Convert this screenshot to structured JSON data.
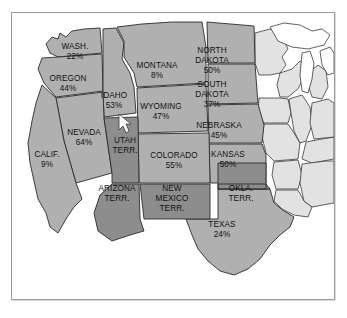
{
  "figure": {
    "kind": "thematic-map",
    "region": "Western United States",
    "frame_border_color": "#9a9a9a",
    "background_color": "#ffffff"
  },
  "legend_colors": {
    "shaded_state_fill": "#b0b0b0",
    "territory_fill": "#8d8d8d",
    "plain_state_fill": "#e2e2e2",
    "water_fill": "#ffffff",
    "outline": "#2b2b2b"
  },
  "cursor": {
    "name": "mouse-pointer",
    "x": 118,
    "y": 113,
    "color": "#ffffff"
  },
  "map_data": {
    "type": "choropleth-map",
    "title": "",
    "value_suffix": "%",
    "regions": [
      {
        "id": "washington",
        "name": "WASH.",
        "value": "22%",
        "has_value": true,
        "class": "shaded",
        "label_x": 63,
        "label_y": 36,
        "line2_dy": 10
      },
      {
        "id": "oregon",
        "name": "OREGON",
        "value": "44%",
        "has_value": true,
        "class": "shaded",
        "label_x": 56,
        "label_y": 70,
        "line2_dy": 10
      },
      {
        "id": "idaho",
        "name": "IDAHO",
        "value": "53%",
        "has_value": true,
        "class": "shaded",
        "label_x": 101,
        "label_y": 85,
        "line2_dy": 10
      },
      {
        "id": "montana",
        "name": "MONTANA",
        "value": "8%",
        "has_value": true,
        "class": "shaded",
        "label_x": 152,
        "label_y": 55,
        "line2_dy": 10
      },
      {
        "id": "wyoming",
        "name": "WYOMING",
        "value": "47%",
        "has_value": true,
        "class": "shaded",
        "label_x": 157,
        "label_y": 98,
        "line2_dy": 10
      },
      {
        "id": "north-dakota",
        "name": "NORTH DAKOTA",
        "value": "50%",
        "has_value": true,
        "class": "shaded",
        "label_x": 219,
        "label_y": 44,
        "line2_dy": 10
      },
      {
        "id": "south-dakota",
        "name": "SOUTH DAKOTA",
        "value": "37%",
        "has_value": true,
        "class": "shaded",
        "label_x": 219,
        "label_y": 82,
        "line2_dy": 10
      },
      {
        "id": "nebraska",
        "name": "NEBRASKA",
        "value": "45%",
        "has_value": true,
        "class": "shaded",
        "label_x": 222,
        "label_y": 120,
        "line2_dy": 10
      },
      {
        "id": "kansas",
        "name": "KANSAS",
        "value": "50%",
        "has_value": true,
        "class": "shaded",
        "label_x": 230,
        "label_y": 152,
        "line2_dy": 10
      },
      {
        "id": "nevada",
        "name": "NEVADA",
        "value": "64%",
        "has_value": true,
        "class": "shaded",
        "label_x": 76,
        "label_y": 131,
        "line2_dy": 10
      },
      {
        "id": "california",
        "name": "CALIF.",
        "value": "9%",
        "has_value": true,
        "class": "shaded",
        "label_x": 39,
        "label_y": 156,
        "line2_dy": 10
      },
      {
        "id": "colorado",
        "name": "COLORADO",
        "value": "55%",
        "has_value": true,
        "class": "shaded",
        "label_x": 170,
        "label_y": 148,
        "line2_dy": 10
      },
      {
        "id": "texas",
        "name": "TEXAS",
        "value": "24%",
        "has_value": true,
        "class": "shaded",
        "label_x": 226,
        "label_y": 225,
        "line2_dy": 10
      },
      {
        "id": "utah-terr",
        "name": "UTAH",
        "value": "TERR.",
        "has_value": false,
        "class": "territory",
        "label_x": 122,
        "label_y": 137,
        "line2_dy": 10
      },
      {
        "id": "arizona-terr",
        "name": "ARIZONA",
        "value": "TERR.",
        "has_value": false,
        "class": "territory",
        "label_x": 115,
        "label_y": 190,
        "line2_dy": 10
      },
      {
        "id": "new-mexico-terr",
        "name": "NEW MEXICO",
        "value": "TERR.",
        "has_value": false,
        "class": "territory",
        "label_x": 172,
        "label_y": 190,
        "line2_dy": 10
      },
      {
        "id": "okla-terr",
        "name": "OKLA.",
        "value": "TERR.",
        "has_value": false,
        "class": "territory",
        "label_x": 245,
        "label_y": 190,
        "line2_dy": 10
      }
    ],
    "labels": {
      "washington": {
        "line1": "WASH.",
        "line2": "22%"
      },
      "oregon": {
        "line1": "OREGON",
        "line2": "44%"
      },
      "idaho": {
        "line1": "IDAHO",
        "line2": "53%"
      },
      "montana": {
        "line1": "MONTANA",
        "line2": "8%"
      },
      "wyoming": {
        "line1": "WYOMING",
        "line2": "47%"
      },
      "north_dakota": {
        "line1": "NORTH",
        "line2": "DAKOTA",
        "line3": "50%"
      },
      "south_dakota": {
        "line1": "SOUTH",
        "line2": "DAKOTA",
        "line3": "37%"
      },
      "nebraska": {
        "line1": "NEBRASKA",
        "line2": "45%"
      },
      "kansas": {
        "line1": "KANSAS",
        "line2": "50%"
      },
      "nevada": {
        "line1": "NEVADA",
        "line2": "64%"
      },
      "california": {
        "line1": "CALIF.",
        "line2": "9%"
      },
      "colorado": {
        "line1": "COLORADO",
        "line2": "55%"
      },
      "texas": {
        "line1": "TEXAS",
        "line2": "24%"
      },
      "utah": {
        "line1": "UTAH",
        "line2": "TERR."
      },
      "arizona": {
        "line1": "ARIZONA",
        "line2": "TERR."
      },
      "new_mexico": {
        "line1": "NEW",
        "line2": "MEXICO",
        "line3": "TERR."
      },
      "oklahoma": {
        "line1": "OKLA.",
        "line2": "TERR."
      }
    }
  }
}
